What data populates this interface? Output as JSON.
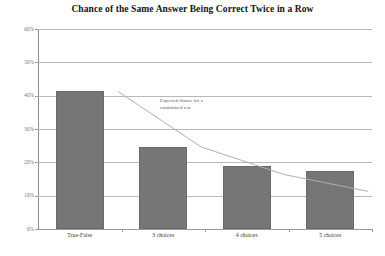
{
  "chart_data": {
    "type": "bar",
    "title": "Chance of the Same Answer Being Correct Twice in a Row",
    "xlabel": "",
    "ylabel": "",
    "categories": [
      "True-False",
      "3 choices",
      "4 choices",
      "5 choices"
    ],
    "values": [
      41.5,
      24.5,
      19.0,
      17.5
    ],
    "series": [
      {
        "name": "Observed chance",
        "type": "bar",
        "values": [
          41.5,
          24.5,
          19.0,
          17.5
        ]
      },
      {
        "name": "Expected chance for a randomized test",
        "type": "line",
        "values": [
          50.0,
          33.3,
          25.0,
          20.0
        ]
      }
    ],
    "ylim": [
      0,
      60
    ],
    "yticks": [
      0,
      10,
      20,
      30,
      40,
      50,
      60
    ],
    "ytick_labels": [
      "0%",
      "10%",
      "20%",
      "30%",
      "40%",
      "50%",
      "60%"
    ],
    "grid": true,
    "legend": "none",
    "annotations": [
      {
        "text_lines": [
          "Expected chance for a",
          "randomized test"
        ],
        "target_series": "Expected chance for a randomized test"
      }
    ],
    "colors": {
      "bar_fill": "#767676",
      "bar_edge": "#6a6a6a",
      "gridline": "#b9b9b9",
      "axis": "#8d8d8d",
      "line": "#b0b0b0",
      "title_text": "#141414",
      "tick_text": "#6d6d6d",
      "annotation_text": "#555555",
      "background": "#ffffff"
    }
  }
}
